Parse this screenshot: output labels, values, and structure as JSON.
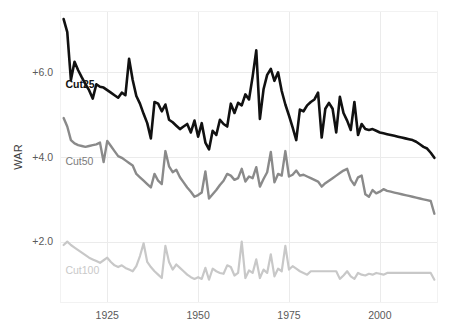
{
  "chart_data": {
    "type": "line",
    "title": "",
    "subtitle": "",
    "xlabel": "",
    "ylabel": "WAR",
    "xlim": [
      1912,
      2016
    ],
    "ylim": [
      0.55,
      7.45
    ],
    "grid": true,
    "legend_position": "inline-left",
    "x_ticks": [
      "1925",
      "1950",
      "1975",
      "2000"
    ],
    "x_tick_values": [
      1925,
      1950,
      1975,
      2000
    ],
    "y_ticks": [
      "+6.0",
      "+4.0",
      "+2.0"
    ],
    "y_tick_values": [
      6.0,
      4.0,
      2.0
    ],
    "x": [
      1913,
      1914,
      1915,
      1916,
      1917,
      1918,
      1919,
      1920,
      1921,
      1922,
      1923,
      1924,
      1925,
      1926,
      1927,
      1928,
      1929,
      1930,
      1931,
      1932,
      1933,
      1934,
      1935,
      1936,
      1937,
      1938,
      1939,
      1940,
      1941,
      1942,
      1943,
      1944,
      1945,
      1946,
      1947,
      1948,
      1949,
      1950,
      1951,
      1952,
      1953,
      1954,
      1955,
      1956,
      1957,
      1958,
      1959,
      1960,
      1961,
      1962,
      1963,
      1964,
      1965,
      1966,
      1967,
      1968,
      1969,
      1970,
      1971,
      1972,
      1973,
      1974,
      1975,
      1976,
      1977,
      1978,
      1979,
      1980,
      1981,
      1982,
      1983,
      1984,
      1985,
      1986,
      1987,
      1988,
      1989,
      1990,
      1991,
      1992,
      1993,
      1994,
      1995,
      1996,
      1997,
      1998,
      1999,
      2000,
      2001,
      2002,
      2003,
      2004,
      2005,
      2006,
      2007,
      2008,
      2009,
      2010,
      2011,
      2012,
      2013,
      2014,
      2015
    ],
    "series": [
      {
        "name": "Cut25",
        "color": "#111111",
        "width": 2.6,
        "label_x": 1913.5,
        "label_y": 5.62,
        "values": [
          7.26,
          6.95,
          5.82,
          6.25,
          6.05,
          5.88,
          5.72,
          5.58,
          5.38,
          5.72,
          5.66,
          5.64,
          5.58,
          5.52,
          5.46,
          5.4,
          5.52,
          5.46,
          6.32,
          5.82,
          5.44,
          5.26,
          5.02,
          4.8,
          4.44,
          5.3,
          5.26,
          5.08,
          5.24,
          4.88,
          4.82,
          4.74,
          4.66,
          4.72,
          4.78,
          4.58,
          4.86,
          4.48,
          4.8,
          4.34,
          4.18,
          4.62,
          4.52,
          4.88,
          4.78,
          4.72,
          5.26,
          5.04,
          5.28,
          5.22,
          5.48,
          5.36,
          5.9,
          6.52,
          4.9,
          5.6,
          5.94,
          6.08,
          5.8,
          6.0,
          5.56,
          5.24,
          4.98,
          4.7,
          4.4,
          5.12,
          5.08,
          5.22,
          5.3,
          5.36,
          5.52,
          4.46,
          5.14,
          5.28,
          5.14,
          4.58,
          5.42,
          5.04,
          4.86,
          4.64,
          5.3,
          4.52,
          4.78,
          4.66,
          4.64,
          4.66,
          4.62,
          4.58,
          4.56,
          4.54,
          4.52,
          4.5,
          4.48,
          4.46,
          4.44,
          4.42,
          4.4,
          4.36,
          4.3,
          4.24,
          4.2,
          4.1,
          3.98
        ]
      },
      {
        "name": "Cut50",
        "color": "#8a8a8a",
        "width": 2.4,
        "label_x": 1913.5,
        "label_y": 3.82,
        "values": [
          4.92,
          4.72,
          4.4,
          4.32,
          4.28,
          4.26,
          4.24,
          4.26,
          4.28,
          4.3,
          4.34,
          3.88,
          4.38,
          4.26,
          4.14,
          4.02,
          3.98,
          3.92,
          3.86,
          3.8,
          3.6,
          3.52,
          3.44,
          3.36,
          3.28,
          3.6,
          3.44,
          3.36,
          4.14,
          3.78,
          3.64,
          3.7,
          3.52,
          3.4,
          3.28,
          3.18,
          3.06,
          3.1,
          3.16,
          3.66,
          3.02,
          3.12,
          3.22,
          3.34,
          3.44,
          3.6,
          3.56,
          3.46,
          3.5,
          3.72,
          3.42,
          3.54,
          3.5,
          3.76,
          3.3,
          3.48,
          3.64,
          4.12,
          3.4,
          3.6,
          3.56,
          4.14,
          3.54,
          3.58,
          3.68,
          3.56,
          3.58,
          3.54,
          3.5,
          3.46,
          3.42,
          3.3,
          3.38,
          3.44,
          3.5,
          3.56,
          3.62,
          3.68,
          3.72,
          3.46,
          3.34,
          3.52,
          3.56,
          3.12,
          3.06,
          3.22,
          3.14,
          3.18,
          3.24,
          3.2,
          3.18,
          3.16,
          3.14,
          3.12,
          3.1,
          3.08,
          3.06,
          3.04,
          3.02,
          3.0,
          2.98,
          2.96,
          2.66
        ]
      },
      {
        "name": "Cut100",
        "color": "#c8c8c8",
        "width": 2.2,
        "label_x": 1913.5,
        "label_y": 1.24,
        "values": [
          1.92,
          2.0,
          1.92,
          1.86,
          1.8,
          1.74,
          1.68,
          1.62,
          1.58,
          1.54,
          1.5,
          1.56,
          1.62,
          1.52,
          1.44,
          1.4,
          1.44,
          1.38,
          1.34,
          1.3,
          1.42,
          1.66,
          1.96,
          1.52,
          1.4,
          1.3,
          1.22,
          1.14,
          1.9,
          1.52,
          1.34,
          1.46,
          1.38,
          1.3,
          1.22,
          1.16,
          1.12,
          1.16,
          1.12,
          1.38,
          1.1,
          1.36,
          1.3,
          1.26,
          1.24,
          1.44,
          1.4,
          1.2,
          1.26,
          2.0,
          1.14,
          1.32,
          1.26,
          1.58,
          1.14,
          1.34,
          1.26,
          1.7,
          1.18,
          1.36,
          1.3,
          1.9,
          1.34,
          1.42,
          1.36,
          1.3,
          1.26,
          1.22,
          1.3,
          1.3,
          1.3,
          1.3,
          1.3,
          1.3,
          1.3,
          1.3,
          1.12,
          1.2,
          1.3,
          1.18,
          1.12,
          1.26,
          1.22,
          1.2,
          1.24,
          1.22,
          1.26,
          1.24,
          1.22,
          1.26,
          1.26,
          1.26,
          1.26,
          1.26,
          1.26,
          1.26,
          1.26,
          1.26,
          1.26,
          1.26,
          1.26,
          1.26,
          1.1
        ]
      }
    ]
  },
  "plot": {
    "left": 60,
    "right": 438,
    "top": 11,
    "bottom": 303,
    "bg": "#ffffff",
    "grid_color": "#ebebeb"
  },
  "axis": {
    "y_title": "WAR"
  }
}
